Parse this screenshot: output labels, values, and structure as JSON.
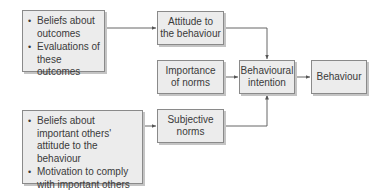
{
  "diagram": {
    "nodes": {
      "beliefs_outcomes": {
        "items": [
          "Beliefs about outcomes",
          "Evaluations of these outcomes"
        ]
      },
      "attitude": {
        "label_line1": "Attitude to",
        "label_line2": "the behaviour"
      },
      "importance": {
        "label_line1": "Importance",
        "label_line2": "of norms"
      },
      "intention": {
        "label_line1": "Behavioural",
        "label_line2": "intention"
      },
      "behaviour": {
        "label": "Behaviour"
      },
      "beliefs_others": {
        "items": [
          "Beliefs about important others' attitude to the behaviour",
          "Motivation to comply with important others"
        ]
      },
      "subjective": {
        "label_line1": "Subjective",
        "label_line2": "norms"
      }
    },
    "edges": [
      {
        "from": "beliefs_outcomes",
        "to": "attitude"
      },
      {
        "from": "attitude",
        "to": "intention"
      },
      {
        "from": "importance",
        "to": "intention"
      },
      {
        "from": "intention",
        "to": "behaviour"
      },
      {
        "from": "beliefs_others",
        "to": "subjective"
      },
      {
        "from": "subjective",
        "to": "intention"
      }
    ],
    "colors": {
      "box_fill": "#ececec",
      "box_border": "#8a8a8a",
      "line": "#555555"
    }
  }
}
